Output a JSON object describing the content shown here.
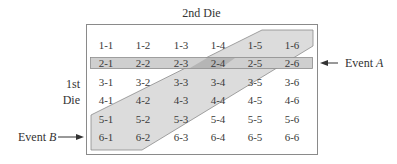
{
  "title": "2nd Die",
  "side_label": {
    "line1": "1st",
    "line2": "Die"
  },
  "events": {
    "a": {
      "prefix": "Event ",
      "letter": "A"
    },
    "b": {
      "prefix": "Event ",
      "letter": "B"
    }
  },
  "colors": {
    "box_border": "#8a8a8a",
    "event_a_fill": "#cfcfcf",
    "event_b_fill": "#dcdcdc",
    "overlap_fill": "#b5b5b5",
    "band_stroke": "#8c8c8c",
    "text": "#333333"
  },
  "grid": {
    "rows": [
      [
        "1-1",
        "1-2",
        "1-3",
        "1-4",
        "1-5",
        "1-6"
      ],
      [
        "2-1",
        "2-2",
        "2-3",
        "2-4",
        "2-5",
        "2-6"
      ],
      [
        "3-1",
        "3-2",
        "3-3",
        "3-4",
        "3-5",
        "3-6"
      ],
      [
        "4-1",
        "4-2",
        "4-3",
        "4-4",
        "4-5",
        "4-6"
      ],
      [
        "5-1",
        "5-2",
        "5-3",
        "5-4",
        "5-5",
        "5-6"
      ],
      [
        "6-1",
        "6-2",
        "6-3",
        "6-4",
        "6-5",
        "6-6"
      ]
    ]
  }
}
